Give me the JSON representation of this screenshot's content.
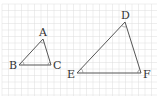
{
  "figure": {
    "grid": {
      "spacing": 6.5,
      "color": "#dcdcdc"
    },
    "line_color": "#555555",
    "triangles": [
      {
        "name": "ABC",
        "vertices": {
          "A": {
            "x": 43,
            "y": 39,
            "label": "A"
          },
          "B": {
            "x": 19,
            "y": 65,
            "label": "B"
          },
          "C": {
            "x": 51,
            "y": 65,
            "label": "C"
          }
        }
      },
      {
        "name": "DEF",
        "vertices": {
          "D": {
            "x": 125,
            "y": 22,
            "label": "D"
          },
          "E": {
            "x": 77,
            "y": 73,
            "label": "E"
          },
          "F": {
            "x": 141,
            "y": 73,
            "label": "F"
          }
        }
      }
    ]
  }
}
